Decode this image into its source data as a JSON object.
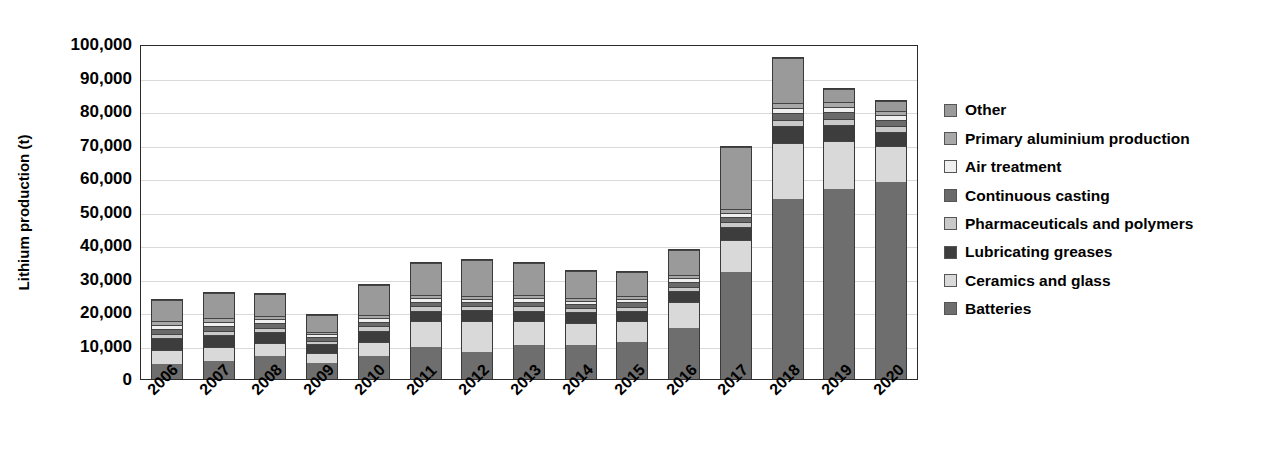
{
  "chart_data": {
    "type": "bar",
    "subtype": "stacked-bar",
    "title": "",
    "subtitle": "",
    "xlabel": "",
    "ylabel": "Lithium production (t)",
    "ylim": [
      0,
      100000
    ],
    "ytick_step": 10000,
    "ytick_labels": [
      "100,000",
      "90,000",
      "80,000",
      "70,000",
      "60,000",
      "50,000",
      "40,000",
      "30,000",
      "20,000",
      "10,000",
      "0"
    ],
    "ytick_values": [
      100000,
      90000,
      80000,
      70000,
      60000,
      50000,
      40000,
      30000,
      20000,
      10000,
      0
    ],
    "grid": true,
    "grid_axis": "y",
    "legend_position": "right",
    "categories": [
      "2006",
      "2007",
      "2008",
      "2009",
      "2010",
      "2011",
      "2012",
      "2013",
      "2014",
      "2015",
      "2016",
      "2017",
      "2018",
      "2019",
      "2020"
    ],
    "stack_order_bottom_to_top": [
      "Batteries",
      "Ceramics and glass",
      "Lubricating greases",
      "Pharmaceuticals and polymers",
      "Continuous casting",
      "Air treatment",
      "Primary aluminium production",
      "Other"
    ],
    "series": [
      {
        "name": "Batteries",
        "color": "#6e6e6e",
        "values": [
          4600,
          5300,
          6800,
          4800,
          6800,
          9600,
          8200,
          10300,
          10200,
          11000,
          15300,
          32000,
          53800,
          56700,
          58900
        ]
      },
      {
        "name": "Ceramics and glass",
        "color": "#d9d9d9",
        "values": [
          4000,
          4200,
          3900,
          3100,
          4300,
          7600,
          9200,
          6900,
          6600,
          6400,
          7700,
          9600,
          16700,
          14400,
          10600
        ]
      },
      {
        "name": "Lubricating greases",
        "color": "#3d3d3d",
        "values": [
          3500,
          3500,
          3300,
          2500,
          3300,
          3200,
          3100,
          3200,
          3100,
          3000,
          3300,
          3700,
          5000,
          4700,
          4200
        ]
      },
      {
        "name": "Pharmaceuticals and polymers",
        "color": "#c9c9c9",
        "values": [
          1400,
          1400,
          1300,
          1000,
          1300,
          1300,
          1200,
          1300,
          1200,
          1200,
          1300,
          1500,
          1900,
          1900,
          1800
        ]
      },
      {
        "name": "Continuous casting",
        "color": "#6a6a6a",
        "values": [
          1500,
          1500,
          1400,
          1100,
          1400,
          1400,
          1300,
          1400,
          1300,
          1300,
          1400,
          1600,
          2000,
          2000,
          1900
        ]
      },
      {
        "name": "Air treatment",
        "color": "#efefef",
        "values": [
          1200,
          1200,
          1100,
          900,
          1100,
          1100,
          1000,
          1100,
          1000,
          1000,
          1100,
          1300,
          1600,
          1600,
          1500
        ]
      },
      {
        "name": "Primary aluminium production",
        "color": "#a8a8a8",
        "values": [
          1000,
          1000,
          900,
          700,
          900,
          900,
          800,
          900,
          800,
          800,
          900,
          1000,
          1300,
          1300,
          1200
        ]
      },
      {
        "name": "Other",
        "color": "#9a9a9a",
        "values": [
          6300,
          7600,
          6700,
          4900,
          9100,
          9400,
          10700,
          9500,
          8200,
          7300,
          7400,
          18700,
          13400,
          4100,
          3000
        ]
      }
    ],
    "totals": [
      23500,
      25700,
      25400,
      19000,
      28200,
      34500,
      35500,
      34600,
      32400,
      32000,
      38400,
      69400,
      95700,
      86700,
      83100
    ],
    "annotations": []
  },
  "axes": {
    "y_title": "Lithium production (t)"
  },
  "legend": {
    "items": [
      {
        "label": "Other",
        "color": "#9a9a9a"
      },
      {
        "label": "Primary aluminium production",
        "color": "#a8a8a8"
      },
      {
        "label": "Air treatment",
        "color": "#efefef"
      },
      {
        "label": "Continuous casting",
        "color": "#6a6a6a"
      },
      {
        "label": "Pharmaceuticals and polymers",
        "color": "#c9c9c9"
      },
      {
        "label": "Lubricating greases",
        "color": "#3d3d3d"
      },
      {
        "label": "Ceramics and glass",
        "color": "#d9d9d9"
      },
      {
        "label": "Batteries",
        "color": "#6e6e6e"
      }
    ]
  },
  "style": {
    "axis_color": "#2b2b2b",
    "grid_color": "#d9d9d9",
    "text_color": "#000000",
    "background": "#ffffff"
  }
}
